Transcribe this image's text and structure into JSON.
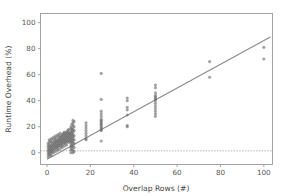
{
  "chart_data": {
    "type": "scatter",
    "title": "",
    "xlabel": "Overlap Rows (#)",
    "ylabel": "Runtime Overhead (%)",
    "xlim": [
      -3,
      104
    ],
    "ylim": [
      -9,
      107
    ],
    "xticks": [
      0,
      20,
      40,
      60,
      80,
      100
    ],
    "yticks": [
      0,
      20,
      40,
      60,
      80,
      100
    ],
    "xticklabels": [
      "0",
      "20",
      "40",
      "60",
      "80",
      "100"
    ],
    "yticklabels": [
      "0",
      "20",
      "40",
      "60",
      "80",
      "100"
    ],
    "grid": false,
    "legend": null,
    "point_color": "#6b6b6b",
    "line_color": "#8a8a8a",
    "reference_line_color": "#9a9a9a",
    "axis_color": "#9a9a9a",
    "background": "#ffffff",
    "series": [
      {
        "name": "Runtime overhead samples",
        "marker": "circle",
        "points": [
          [
            0.5,
            1
          ],
          [
            0.5,
            3
          ],
          [
            0.5,
            5
          ],
          [
            0.5,
            7
          ],
          [
            0.5,
            -1
          ],
          [
            0.5,
            -3
          ],
          [
            1,
            2
          ],
          [
            1,
            4
          ],
          [
            1,
            6
          ],
          [
            1,
            8
          ],
          [
            1,
            0
          ],
          [
            1,
            -2
          ],
          [
            1,
            10
          ],
          [
            1.5,
            3
          ],
          [
            1.5,
            5
          ],
          [
            1.5,
            9
          ],
          [
            1.5,
            1
          ],
          [
            1.5,
            -1
          ],
          [
            2,
            4
          ],
          [
            2,
            6
          ],
          [
            2,
            8
          ],
          [
            2,
            11
          ],
          [
            2,
            2
          ],
          [
            2,
            0
          ],
          [
            2,
            -2
          ],
          [
            2.5,
            5
          ],
          [
            2.5,
            7
          ],
          [
            2.5,
            3
          ],
          [
            2.5,
            10
          ],
          [
            2.5,
            1
          ],
          [
            3,
            6
          ],
          [
            3,
            8
          ],
          [
            3,
            12
          ],
          [
            3,
            4
          ],
          [
            3,
            2
          ],
          [
            3,
            0
          ],
          [
            3.5,
            7
          ],
          [
            3.5,
            9
          ],
          [
            3.5,
            5
          ],
          [
            3.5,
            11
          ],
          [
            3.5,
            3
          ],
          [
            4,
            8
          ],
          [
            4,
            10
          ],
          [
            4,
            6
          ],
          [
            4,
            13
          ],
          [
            4,
            4
          ],
          [
            4,
            1
          ],
          [
            4.5,
            9
          ],
          [
            4.5,
            7
          ],
          [
            4.5,
            12
          ],
          [
            4.5,
            5
          ],
          [
            4.5,
            3
          ],
          [
            5,
            10
          ],
          [
            5,
            8
          ],
          [
            5,
            14
          ],
          [
            5,
            6
          ],
          [
            5,
            4
          ],
          [
            5,
            2
          ],
          [
            5.5,
            11
          ],
          [
            5.5,
            9
          ],
          [
            5.5,
            7
          ],
          [
            5.5,
            13
          ],
          [
            5.5,
            5
          ],
          [
            6,
            12
          ],
          [
            6,
            10
          ],
          [
            6,
            8
          ],
          [
            6,
            15
          ],
          [
            6,
            6
          ],
          [
            6,
            3
          ],
          [
            6.5,
            11
          ],
          [
            6.5,
            9
          ],
          [
            6.5,
            13
          ],
          [
            6.5,
            7
          ],
          [
            6.5,
            5
          ],
          [
            7,
            12
          ],
          [
            7,
            10
          ],
          [
            7,
            14
          ],
          [
            7,
            8
          ],
          [
            7,
            6
          ],
          [
            7,
            4
          ],
          [
            7.5,
            13
          ],
          [
            7.5,
            11
          ],
          [
            7.5,
            9
          ],
          [
            7.5,
            15
          ],
          [
            7.5,
            7
          ],
          [
            8,
            14
          ],
          [
            8,
            12
          ],
          [
            8,
            10
          ],
          [
            8,
            8
          ],
          [
            8,
            16
          ],
          [
            8,
            5
          ],
          [
            8.5,
            13
          ],
          [
            8.5,
            11
          ],
          [
            8.5,
            9
          ],
          [
            8.5,
            15
          ],
          [
            8.5,
            7
          ],
          [
            9,
            14
          ],
          [
            9,
            12
          ],
          [
            9,
            10
          ],
          [
            9,
            16
          ],
          [
            9,
            8
          ],
          [
            9,
            6
          ],
          [
            9.5,
            15
          ],
          [
            9.5,
            13
          ],
          [
            9.5,
            11
          ],
          [
            9.5,
            9
          ],
          [
            9.5,
            17
          ],
          [
            10,
            16
          ],
          [
            10,
            14
          ],
          [
            10,
            12
          ],
          [
            10,
            10
          ],
          [
            10,
            8
          ],
          [
            10,
            18
          ],
          [
            10.5,
            15
          ],
          [
            10.5,
            13
          ],
          [
            10.5,
            11
          ],
          [
            10.5,
            9
          ],
          [
            11,
            20
          ],
          [
            11,
            18
          ],
          [
            11,
            16
          ],
          [
            11,
            14
          ],
          [
            11,
            12
          ],
          [
            11,
            10
          ],
          [
            11,
            8
          ],
          [
            11,
            6
          ],
          [
            11,
            4
          ],
          [
            11,
            2
          ],
          [
            11,
            0
          ],
          [
            11.5,
            22
          ],
          [
            11.5,
            19
          ],
          [
            11.5,
            17
          ],
          [
            11.5,
            15
          ],
          [
            11.5,
            13
          ],
          [
            11.5,
            11
          ],
          [
            11.5,
            9
          ],
          [
            11.5,
            7
          ],
          [
            11.5,
            5
          ],
          [
            11.5,
            3
          ],
          [
            12,
            25
          ],
          [
            12,
            23
          ],
          [
            12,
            21
          ],
          [
            12,
            18
          ],
          [
            12,
            16
          ],
          [
            12,
            14
          ],
          [
            12,
            12
          ],
          [
            12,
            10
          ],
          [
            12,
            8
          ],
          [
            12,
            5
          ],
          [
            12,
            2
          ],
          [
            12,
            0
          ],
          [
            12.5,
            24
          ],
          [
            12.5,
            20
          ],
          [
            12.5,
            17
          ],
          [
            12.5,
            13
          ],
          [
            12.5,
            10
          ],
          [
            12.5,
            7
          ],
          [
            12.5,
            4
          ],
          [
            12.5,
            1
          ],
          [
            18,
            23
          ],
          [
            18,
            21
          ],
          [
            18,
            19
          ],
          [
            18,
            17
          ],
          [
            18,
            15
          ],
          [
            18,
            13
          ],
          [
            18,
            11
          ],
          [
            18,
            10
          ],
          [
            25,
            61
          ],
          [
            25,
            41
          ],
          [
            25,
            32
          ],
          [
            25,
            30
          ],
          [
            25,
            28
          ],
          [
            25,
            26
          ],
          [
            25,
            25
          ],
          [
            25,
            24
          ],
          [
            25,
            23
          ],
          [
            25,
            22
          ],
          [
            25,
            21
          ],
          [
            25,
            20
          ],
          [
            25,
            19
          ],
          [
            25,
            18
          ],
          [
            25,
            17
          ],
          [
            25,
            9
          ],
          [
            37,
            42
          ],
          [
            37,
            40
          ],
          [
            37,
            35
          ],
          [
            37,
            33
          ],
          [
            37,
            29
          ],
          [
            37,
            21
          ],
          [
            37,
            20
          ],
          [
            50,
            52
          ],
          [
            50,
            50
          ],
          [
            50,
            46
          ],
          [
            50,
            44
          ],
          [
            50,
            43
          ],
          [
            50,
            42
          ],
          [
            50,
            41
          ],
          [
            50,
            40
          ],
          [
            50,
            38
          ],
          [
            50,
            36
          ],
          [
            50,
            34
          ],
          [
            50,
            32
          ],
          [
            50,
            30
          ],
          [
            50,
            28
          ],
          [
            75,
            70
          ],
          [
            75,
            58
          ],
          [
            100,
            81
          ],
          [
            100,
            72
          ]
        ]
      }
    ],
    "trend_line": {
      "name": "regression fit",
      "x0": 0,
      "y0": -5,
      "x1": 103,
      "y1": 89,
      "slope": 0.912,
      "intercept": -5
    },
    "reference_line": {
      "name": "zero-overhead baseline",
      "y": 1.5,
      "style": "dotted"
    }
  }
}
